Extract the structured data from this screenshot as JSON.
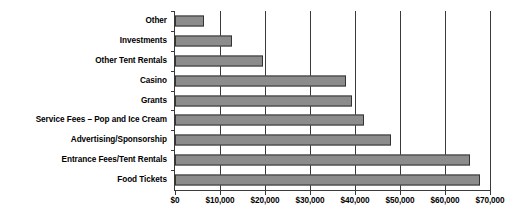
{
  "chart_data": {
    "type": "bar",
    "orientation": "horizontal",
    "title": "",
    "xlabel": "",
    "ylabel": "",
    "xlim": [
      0,
      70000
    ],
    "grid": true,
    "legend": false,
    "categories": [
      "Other",
      "Investments",
      "Other Tent Rentals",
      "Casino",
      "Grants",
      "Service Fees – Pop and Ice Cream",
      "Advertising/Sponsorship",
      "Entrance Fees/Tent Rentals",
      "Food Tickets"
    ],
    "values": [
      6400,
      12600,
      19500,
      38000,
      39300,
      42000,
      48100,
      65500,
      67800
    ],
    "xticks": [
      0,
      10000,
      20000,
      30000,
      40000,
      50000,
      60000,
      70000
    ],
    "xtick_labels": [
      "$0",
      "$10,000",
      "$20,000",
      "$30,000",
      "$40,000",
      "$50,000",
      "$60,000",
      "$70,000"
    ],
    "colors": {
      "bar_fill": "#8c8c8c",
      "bar_stroke": "#333333",
      "axis": "#3a3a3a",
      "text": "#000000",
      "background": "#ffffff"
    }
  }
}
